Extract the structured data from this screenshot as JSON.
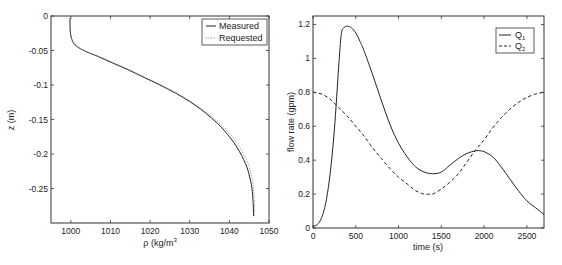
{
  "chart_data": [
    {
      "type": "line",
      "title": "",
      "xlabel": "ρ (kg/m³)",
      "xlabel_base": "ρ (kg/m",
      "xlabel_sup": "3",
      "xlabel_tail": ")",
      "ylabel": "z (m)",
      "xlim": [
        995,
        1050
      ],
      "ylim": [
        -0.3,
        0
      ],
      "xticks": [
        1000,
        1010,
        1020,
        1030,
        1040,
        1050
      ],
      "xtick_labels": [
        "1000",
        "1010",
        "1020",
        "1030",
        "1040",
        "1050"
      ],
      "yticks": [
        0,
        -0.05,
        -0.1,
        -0.15,
        -0.2,
        -0.25
      ],
      "ytick_labels": [
        "0",
        "-0.05",
        "-0.1",
        "-0.15",
        "-0.2",
        "-0.25"
      ],
      "grid": false,
      "legend_position": "top-right",
      "series": [
        {
          "name": "Measured",
          "style": "solid",
          "x": [
            999.8,
            999.8,
            999.9,
            1000.2,
            1000.8,
            1002.0,
            1004.0,
            1007.0,
            1010.5,
            1014.5,
            1018.5,
            1022.5,
            1026.5,
            1030.0,
            1033.0,
            1035.5,
            1037.8,
            1039.6,
            1041.2,
            1042.5,
            1043.6,
            1044.5,
            1045.2,
            1045.7,
            1046.0,
            1046.1
          ],
          "y": [
            -0.003,
            -0.015,
            -0.025,
            -0.033,
            -0.04,
            -0.046,
            -0.052,
            -0.059,
            -0.068,
            -0.078,
            -0.089,
            -0.1,
            -0.112,
            -0.124,
            -0.136,
            -0.148,
            -0.16,
            -0.172,
            -0.184,
            -0.196,
            -0.208,
            -0.22,
            -0.235,
            -0.25,
            -0.27,
            -0.29
          ]
        },
        {
          "name": "Requested",
          "style": "dotted",
          "x": [
            999.8,
            999.8,
            999.9,
            1000.2,
            1000.8,
            1002.0,
            1004.1,
            1007.2,
            1010.8,
            1014.8,
            1018.8,
            1022.8,
            1026.8,
            1030.3,
            1033.4,
            1036.0,
            1038.4,
            1040.3,
            1041.9,
            1043.2,
            1044.3,
            1045.1,
            1045.7,
            1046.1,
            1046.3,
            1046.3
          ],
          "y": [
            -0.003,
            -0.015,
            -0.025,
            -0.033,
            -0.04,
            -0.046,
            -0.052,
            -0.059,
            -0.068,
            -0.078,
            -0.089,
            -0.1,
            -0.112,
            -0.124,
            -0.136,
            -0.148,
            -0.16,
            -0.172,
            -0.184,
            -0.196,
            -0.208,
            -0.22,
            -0.235,
            -0.25,
            -0.27,
            -0.29
          ]
        }
      ]
    },
    {
      "type": "line",
      "title": "",
      "xlabel": "time (s)",
      "ylabel": "flow rate (gpm)",
      "xlim": [
        0,
        2700
      ],
      "ylim": [
        0,
        1.25
      ],
      "xticks": [
        0,
        500,
        1000,
        1500,
        2000,
        2500
      ],
      "xtick_labels": [
        "0",
        "500",
        "1000",
        "1500",
        "2000",
        "2500"
      ],
      "yticks": [
        0,
        0.2,
        0.4,
        0.6,
        0.8,
        1,
        1.2
      ],
      "ytick_labels": [
        "0",
        "0.2",
        "0.4",
        "0.6",
        "0.8",
        "1",
        "1.2"
      ],
      "grid": false,
      "legend_position": "top-right",
      "series": [
        {
          "name": "Q1",
          "label_base": "Q",
          "label_sub": "1",
          "style": "solid",
          "x": [
            0,
            50,
            100,
            150,
            200,
            250,
            300,
            330,
            360,
            400,
            450,
            500,
            550,
            600,
            700,
            800,
            900,
            1000,
            1100,
            1200,
            1300,
            1400,
            1500,
            1600,
            1700,
            1800,
            1900,
            1950,
            2000,
            2100,
            2200,
            2300,
            2400,
            2500,
            2600,
            2700
          ],
          "y": [
            0.01,
            0.02,
            0.06,
            0.15,
            0.32,
            0.58,
            0.95,
            1.14,
            1.18,
            1.19,
            1.18,
            1.15,
            1.1,
            1.04,
            0.9,
            0.75,
            0.61,
            0.5,
            0.42,
            0.36,
            0.33,
            0.32,
            0.33,
            0.37,
            0.41,
            0.44,
            0.455,
            0.455,
            0.45,
            0.42,
            0.36,
            0.29,
            0.22,
            0.16,
            0.12,
            0.08
          ]
        },
        {
          "name": "Q2",
          "label_base": "Q",
          "label_sub": "2",
          "style": "dashed",
          "x": [
            0,
            100,
            200,
            300,
            400,
            500,
            600,
            700,
            800,
            900,
            1000,
            1100,
            1200,
            1300,
            1350,
            1400,
            1500,
            1600,
            1700,
            1800,
            1900,
            2000,
            2100,
            2200,
            2300,
            2400,
            2500,
            2600,
            2700
          ],
          "y": [
            0.8,
            0.79,
            0.76,
            0.71,
            0.66,
            0.6,
            0.54,
            0.47,
            0.41,
            0.35,
            0.3,
            0.26,
            0.22,
            0.2,
            0.2,
            0.2,
            0.23,
            0.27,
            0.32,
            0.39,
            0.46,
            0.52,
            0.59,
            0.65,
            0.7,
            0.74,
            0.77,
            0.79,
            0.8
          ]
        }
      ]
    }
  ]
}
